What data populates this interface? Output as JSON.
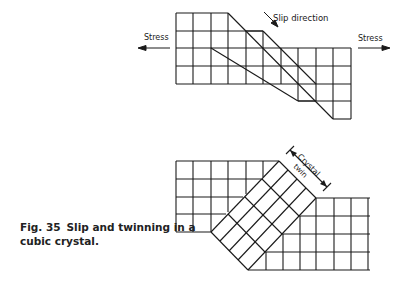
{
  "figure": {
    "number": "Fig. 35",
    "caption_line1": "Slip and twinning in a",
    "caption_line2": "cubic crystal."
  },
  "top_diagram": {
    "title": "slip",
    "stress_left_label": "Stress",
    "stress_right_label": "Stress",
    "slip_direction_label": "Slip direction"
  },
  "bottom_diagram": {
    "title": "twinning",
    "twin_label_line1": "Crystal",
    "twin_label_line2": "twin"
  },
  "colors": {
    "line": "#1a1a1a",
    "background": "#ffffff"
  }
}
